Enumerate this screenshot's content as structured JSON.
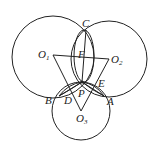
{
  "figure": {
    "circles": [
      {
        "name": "O1",
        "cx": 53,
        "cy": 57,
        "r": 41
      },
      {
        "name": "O2",
        "cx": 109,
        "cy": 59,
        "r": 38
      },
      {
        "name": "O3",
        "cx": 81,
        "cy": 111,
        "r": 29
      }
    ],
    "points": {
      "C": {
        "label": "C",
        "x": 86,
        "y": 30
      },
      "P": {
        "label": "P",
        "x": 82,
        "y": 82
      },
      "O1": {
        "label": "O",
        "sub": "1",
        "x": 53,
        "y": 55
      },
      "O2": {
        "label": "O",
        "sub": "2",
        "x": 109,
        "y": 59
      },
      "O3": {
        "label": "O",
        "sub": "3",
        "x": 81,
        "y": 111
      },
      "A": {
        "label": "A",
        "x": 104,
        "y": 96
      },
      "B": {
        "label": "B",
        "x": 59,
        "y": 96
      },
      "D": {
        "label": "D",
        "x": 68,
        "y": 94
      },
      "E": {
        "label": "E",
        "x": 97,
        "y": 82
      },
      "F": {
        "label": "F",
        "x": 84,
        "y": 49
      }
    }
  }
}
